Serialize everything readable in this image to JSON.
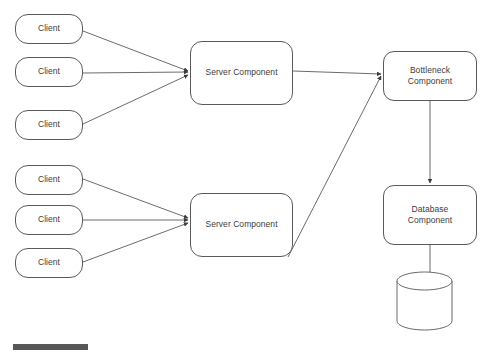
{
  "diagram": {
    "background_color": "#ffffff",
    "stroke_color": "#5a5a5a",
    "arrow_color": "#4a4a4a",
    "text_color": "#3c3c3c",
    "nodes": [
      {
        "id": "client-1",
        "label": "Client",
        "shape": "rounded-rectangle",
        "x": 15,
        "y": 14,
        "w": 68,
        "h": 30
      },
      {
        "id": "client-2",
        "label": "Client",
        "shape": "rounded-rectangle",
        "x": 15,
        "y": 57,
        "w": 68,
        "h": 30
      },
      {
        "id": "client-3",
        "label": "Client",
        "shape": "rounded-rectangle",
        "x": 15,
        "y": 110,
        "w": 68,
        "h": 30
      },
      {
        "id": "client-4",
        "label": "Client",
        "shape": "rounded-rectangle",
        "x": 15,
        "y": 165,
        "w": 68,
        "h": 30
      },
      {
        "id": "client-5",
        "label": "Client",
        "shape": "rounded-rectangle",
        "x": 15,
        "y": 205,
        "w": 68,
        "h": 30
      },
      {
        "id": "client-6",
        "label": "Client",
        "shape": "rounded-rectangle",
        "x": 15,
        "y": 248,
        "w": 68,
        "h": 30
      },
      {
        "id": "server-1",
        "label": "Server Component",
        "shape": "rounded-rectangle",
        "x": 190,
        "y": 41,
        "w": 103,
        "h": 64
      },
      {
        "id": "server-2",
        "label": "Server Component",
        "shape": "rounded-rectangle",
        "x": 190,
        "y": 193,
        "w": 103,
        "h": 64
      },
      {
        "id": "bottleneck",
        "label": "Bottleneck\nComponent",
        "shape": "rounded-rectangle",
        "x": 383,
        "y": 51,
        "w": 94,
        "h": 50
      },
      {
        "id": "database",
        "label": "Database\nComponent",
        "shape": "rounded-rectangle",
        "x": 383,
        "y": 185,
        "w": 94,
        "h": 60
      },
      {
        "id": "datastore",
        "label": "",
        "shape": "cylinder",
        "x": 397,
        "y": 272,
        "w": 55,
        "h": 58
      }
    ],
    "edges": [
      {
        "from": "client-1",
        "to": "server-1",
        "arrowhead": true
      },
      {
        "from": "client-2",
        "to": "server-1",
        "arrowhead": true
      },
      {
        "from": "client-3",
        "to": "server-1",
        "arrowhead": true
      },
      {
        "from": "client-4",
        "to": "server-2",
        "arrowhead": true
      },
      {
        "from": "client-5",
        "to": "server-2",
        "arrowhead": true
      },
      {
        "from": "client-6",
        "to": "server-2",
        "arrowhead": true
      },
      {
        "from": "server-1",
        "to": "bottleneck",
        "arrowhead": true
      },
      {
        "from": "server-2",
        "to": "bottleneck",
        "arrowhead": true
      },
      {
        "from": "bottleneck",
        "to": "database",
        "arrowhead": true
      },
      {
        "from": "database",
        "to": "datastore",
        "arrowhead": false
      }
    ]
  },
  "bottom_chrome": {
    "bar_label": "",
    "truncated_text": ""
  }
}
